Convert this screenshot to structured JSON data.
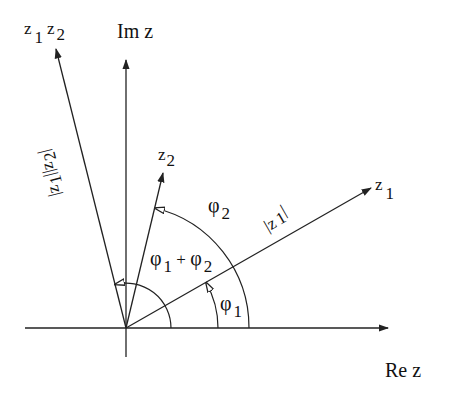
{
  "diagram": {
    "colors": {
      "line": "#222222",
      "background": "#ffffff"
    },
    "origin": [
      126,
      328
    ],
    "axes": {
      "re": {
        "label": "Re z",
        "from": [
          25,
          328
        ],
        "to": [
          388,
          328
        ]
      },
      "im": {
        "label": "Im z",
        "from": [
          126,
          357
        ],
        "to": [
          126,
          60
        ]
      }
    },
    "vectors": [
      {
        "name": "z1",
        "label_main": "z",
        "label_sub": "1",
        "to": [
          371,
          188
        ]
      },
      {
        "name": "z2",
        "label_main": "z",
        "label_sub": "2",
        "to": [
          163,
          173
        ]
      },
      {
        "name": "z1z2",
        "label_main": "z",
        "label_sub": "1",
        "label_main2": "z",
        "label_sub2": "2",
        "to": [
          56,
          49
        ]
      }
    ],
    "magnitude_labels": {
      "z1": {
        "text_pre": "|z",
        "sub": "1",
        "text_post": "|"
      },
      "z1z2": {
        "text_pre": "|z",
        "sub1": "1",
        "mid": "||z",
        "sub2": "2",
        "text_post": "|"
      }
    },
    "angles": {
      "phi1": {
        "main": "φ",
        "sub": "1",
        "radius": 92
      },
      "phi2": {
        "main": "φ",
        "sub": "2",
        "radius": 123
      },
      "phi1_plus_phi2": {
        "main1": "φ",
        "sub1": "1",
        "plus": " + ",
        "main2": "φ",
        "sub2": "2",
        "radius": 45
      }
    },
    "axis_labels": {
      "re": "Re z",
      "im": "Im z"
    }
  }
}
